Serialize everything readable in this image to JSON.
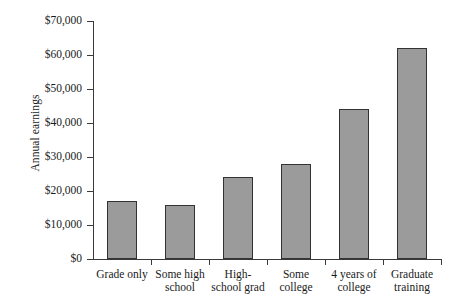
{
  "chart_data": {
    "type": "bar",
    "title": "",
    "xlabel": "",
    "ylabel": "Annual earnings",
    "categories": [
      "Grade only",
      "Some high school",
      "High-school grad",
      "Some college",
      "4 years of college",
      "Graduate training"
    ],
    "values": [
      17000,
      16000,
      24000,
      28000,
      44000,
      62000
    ],
    "ylim": [
      0,
      70000
    ],
    "ytick_values": [
      0,
      10000,
      20000,
      30000,
      40000,
      50000,
      60000,
      70000
    ],
    "ytick_labels": [
      "$0",
      "$10,000",
      "$20,000",
      "$30,000",
      "$40,000",
      "$50,000",
      "$60,000",
      "$70,000"
    ],
    "grid": false,
    "legend": null,
    "bar_color": "#9b9b9b",
    "bar_border_color": "#333333",
    "axis_color": "#3a3a3a"
  }
}
